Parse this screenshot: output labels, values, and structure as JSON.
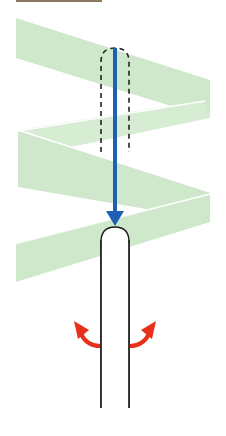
{
  "diagram": {
    "title": "",
    "colors": {
      "background": "#ffffff",
      "fabric": "#cfe8cc",
      "fabric_edge": "#ffffff",
      "needle_arrow": "#1f5fb4",
      "rod_outline": "#1a1a1a",
      "rod_fill": "#ffffff",
      "dashed_outline": "#222222",
      "rotation_arrows": "#e8311a",
      "top_strip": "#8a7a60"
    },
    "elements": [
      {
        "name": "fabric-band-top",
        "shape": "slanted band"
      },
      {
        "name": "fabric-band-upper-middle",
        "shape": "slanted band"
      },
      {
        "name": "fabric-band-lower-middle",
        "shape": "slanted band"
      },
      {
        "name": "fabric-band-bottom",
        "shape": "slanted band"
      },
      {
        "name": "dashed-rod-outline",
        "shape": "dashed rounded rectangle"
      },
      {
        "name": "downward-arrow",
        "shape": "vertical arrow",
        "direction": "down"
      },
      {
        "name": "rod",
        "shape": "rounded-top vertical rod"
      },
      {
        "name": "rotation-arrow-left",
        "shape": "curved arrow",
        "direction": "up-left"
      },
      {
        "name": "rotation-arrow-right",
        "shape": "curved arrow",
        "direction": "up-right"
      }
    ]
  }
}
